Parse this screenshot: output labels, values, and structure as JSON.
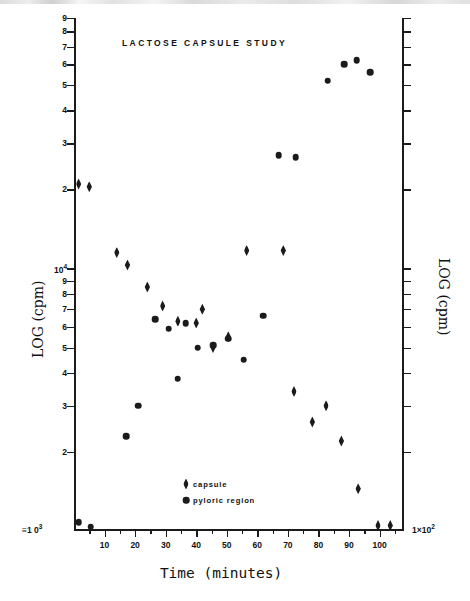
{
  "chart_data": {
    "type": "scatter",
    "title": "LACTOSE  CAPSULE  STUDY",
    "xlabel": "Time (minutes)",
    "ylabel_left": "LOG (cpm)",
    "ylabel_right": "LOG (cpm)",
    "grid": false,
    "legend_position": "inside-bottom-center",
    "xlim": [
      0,
      108
    ],
    "x_ticks_major": [
      10,
      20,
      30,
      40,
      50,
      60,
      70,
      80,
      90,
      100
    ],
    "x_ticks_minor": [
      5,
      15,
      25,
      35,
      45,
      55,
      65,
      75,
      85,
      95,
      105
    ],
    "x_tick_labels": [
      "10",
      "20",
      "30",
      "40",
      "50",
      "60",
      "70",
      "80",
      "90",
      "100"
    ],
    "y_axis_left": {
      "scale": "log",
      "range_min": 1000,
      "range_max": 90000,
      "base_label": "≡1 0",
      "base_exponent": "3",
      "tick_labels": [
        "8",
        "7",
        "6",
        "5",
        "4",
        "3",
        "2",
        "10",
        "9",
        "8",
        "7",
        "6",
        "5",
        "4",
        "3",
        "2"
      ],
      "decade_tick_label": "10",
      "decade_tick_exponent": "4"
    },
    "y_axis_right": {
      "scale": "log",
      "range_min": 100,
      "range_max": 9000,
      "base_label": "1×10",
      "base_exponent": "2",
      "tick_labels": [
        "8",
        "7",
        "6",
        "5",
        "4",
        "3",
        "2",
        "10",
        "9",
        "8",
        "7",
        "6",
        "5",
        "4",
        "3",
        "2"
      ],
      "decade_tick_label": "10",
      "decade_tick_exponent": "3"
    },
    "series": [
      {
        "name": "capsule",
        "marker": "diamond",
        "color": "#1b1b1b",
        "points": [
          {
            "x": 1.5,
            "y": 21000
          },
          {
            "x": 5.0,
            "y": 20500
          },
          {
            "x": 14.0,
            "y": 11500
          },
          {
            "x": 17.5,
            "y": 10300
          },
          {
            "x": 24.0,
            "y": 8500
          },
          {
            "x": 29.0,
            "y": 7200
          },
          {
            "x": 34.0,
            "y": 6300
          },
          {
            "x": 40.0,
            "y": 6200
          },
          {
            "x": 42.0,
            "y": 7000
          },
          {
            "x": 45.5,
            "y": 5000
          },
          {
            "x": 50.5,
            "y": 5500
          },
          {
            "x": 56.5,
            "y": 11700
          },
          {
            "x": 68.5,
            "y": 11700
          },
          {
            "x": 72.0,
            "y": 3400
          },
          {
            "x": 78.0,
            "y": 2600
          },
          {
            "x": 82.5,
            "y": 3000
          },
          {
            "x": 87.5,
            "y": 2200
          },
          {
            "x": 93.0,
            "y": 1450
          },
          {
            "x": 99.5,
            "y": 1050
          },
          {
            "x": 103.5,
            "y": 1050
          }
        ]
      },
      {
        "name": "pyloric region",
        "marker": "circle",
        "color": "#1b1b1b",
        "points": [
          {
            "x": 1.5,
            "y": 1080
          },
          {
            "x": 5.5,
            "y": 1040
          },
          {
            "x": 21.0,
            "y": 3000
          },
          {
            "x": 26.5,
            "y": 6400
          },
          {
            "x": 31.0,
            "y": 5900
          },
          {
            "x": 36.5,
            "y": 6200
          },
          {
            "x": 40.5,
            "y": 5000
          },
          {
            "x": 45.5,
            "y": 5100
          },
          {
            "x": 50.5,
            "y": 5400
          },
          {
            "x": 55.5,
            "y": 4500
          },
          {
            "x": 62.0,
            "y": 6600
          },
          {
            "x": 67.0,
            "y": 27000
          },
          {
            "x": 72.5,
            "y": 26500
          },
          {
            "x": 83.0,
            "y": 52000
          },
          {
            "x": 88.5,
            "y": 60000
          },
          {
            "x": 92.5,
            "y": 62000
          },
          {
            "x": 97.0,
            "y": 56000
          },
          {
            "x": 17.0,
            "y": 2300
          },
          {
            "x": 34.0,
            "y": 3800
          }
        ]
      }
    ],
    "legend": [
      {
        "label": "capsule",
        "marker": "diamond"
      },
      {
        "label": "pyloric region",
        "marker": "circle"
      }
    ]
  }
}
